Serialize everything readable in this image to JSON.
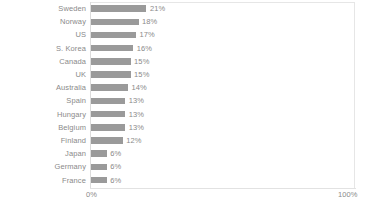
{
  "chart_data": {
    "type": "bar",
    "orientation": "horizontal",
    "title": "",
    "xlabel": "",
    "ylabel": "",
    "categories": [
      "Sweden",
      "Norway",
      "US",
      "S. Korea",
      "Canada",
      "UK",
      "Australia",
      "Spain",
      "Hungary",
      "Belgium",
      "Finland",
      "Japan",
      "Germany",
      "France"
    ],
    "values": [
      21,
      18,
      17,
      16,
      15,
      15,
      14,
      13,
      13,
      13,
      12,
      6,
      6,
      6
    ],
    "value_labels": [
      "21%",
      "18%",
      "17%",
      "16%",
      "15%",
      "15%",
      "14%",
      "13%",
      "13%",
      "13%",
      "12%",
      "6%",
      "6%",
      "6%"
    ],
    "xlim": [
      0,
      100
    ],
    "axis_tick_labels": [
      "0%",
      "100%"
    ],
    "grid": false,
    "legend": false,
    "bar_color": "#9a9a9a",
    "text_color": "#8a8a8a",
    "axis_color": "#e2e2e2"
  },
  "axis": {
    "min_label": "0%",
    "max_label": "100%"
  },
  "footer": {
    "text": ""
  }
}
